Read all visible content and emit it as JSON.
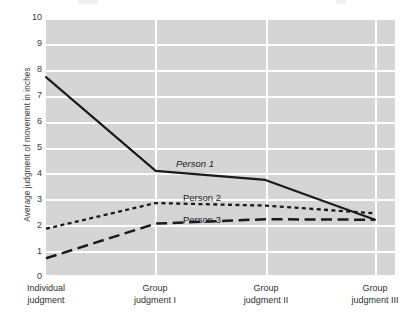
{
  "chart_data": {
    "type": "line",
    "title": "",
    "xlabel": "",
    "ylabel": "Average judgment of movement in inches",
    "categories": [
      "Individual judgment",
      "Group judgment I",
      "Group judgment II",
      "Group judgment III"
    ],
    "category_lines": [
      [
        "Individual",
        "judgment"
      ],
      [
        "Group",
        "judgment I"
      ],
      [
        "Group",
        "judgment II"
      ],
      [
        "Group",
        "judgment III"
      ]
    ],
    "ylim": [
      0,
      10
    ],
    "yticks": [
      0,
      1,
      2,
      3,
      4,
      5,
      6,
      7,
      8,
      9,
      10
    ],
    "grid": true,
    "legend_position": "inline-annotations",
    "series": [
      {
        "name": "Person 1",
        "style": "solid",
        "color": "#1a1a1a",
        "values": [
          7.7,
          4.05,
          3.7,
          2.15
        ]
      },
      {
        "name": "Person 2",
        "style": "dotted",
        "color": "#1a1a1a",
        "values": [
          1.8,
          2.8,
          2.7,
          2.4
        ]
      },
      {
        "name": "Person 3",
        "style": "dashed",
        "color": "#1a1a1a",
        "values": [
          0.65,
          2.0,
          2.17,
          2.15
        ]
      }
    ],
    "annotations": [
      {
        "text": "Person 1",
        "series": "Person 1"
      },
      {
        "text": "Person 2",
        "series": "Person 2"
      },
      {
        "text": "Person 3",
        "series": "Person 3"
      }
    ]
  },
  "colors": {
    "plot_background": "#d5d5d5",
    "gridline": "#ffffff",
    "page_background": "#ffffff",
    "tick_text": "#3a3a3a",
    "axis_title_text": "#3c3c3c",
    "line": "#1a1a1a"
  },
  "ticks": {
    "y": [
      "10",
      "9",
      "8",
      "7",
      "6",
      "5",
      "4",
      "3",
      "2",
      "1",
      "0"
    ]
  }
}
